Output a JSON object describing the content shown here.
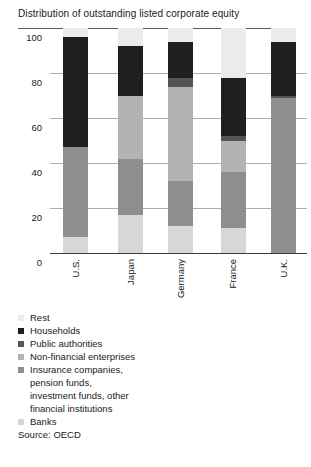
{
  "source_note": "Source: OECD",
  "chart_data": {
    "type": "bar",
    "stacked": true,
    "title": "Distribution of outstanding listed corporate equity",
    "categories": [
      "U.S.",
      "Japan",
      "Germany",
      "France",
      "U.K."
    ],
    "series": [
      {
        "name": "Rest",
        "color": "#ebebeb",
        "values": [
          4,
          8,
          6,
          22,
          6
        ]
      },
      {
        "name": "Households",
        "color": "#1f1f1f",
        "values": [
          49,
          22,
          16,
          26,
          24
        ]
      },
      {
        "name": "Public authorities",
        "color": "#555555",
        "values": [
          0,
          0,
          4,
          2,
          1
        ]
      },
      {
        "name": "Non-financial enterprises",
        "color": "#b3b3b3",
        "values": [
          0,
          28,
          42,
          14,
          0
        ]
      },
      {
        "name": "Insurance companies, pension funds, investment funds, other financial institutions",
        "color": "#8e8e8e",
        "values": [
          40,
          25,
          20,
          25,
          69
        ]
      },
      {
        "name": "Banks",
        "color": "#d7d7d7",
        "values": [
          7,
          17,
          12,
          11,
          0
        ]
      }
    ],
    "ylim": [
      0,
      100
    ],
    "yticks": [
      100,
      80,
      60,
      40,
      20,
      0
    ],
    "grid": true,
    "legend_position": "bottom-left"
  },
  "legend": {
    "items": [
      {
        "label": "Rest",
        "color": "#ebebeb"
      },
      {
        "label": "Households",
        "color": "#1f1f1f"
      },
      {
        "label": "Public authorities",
        "color": "#555555"
      },
      {
        "label": "Non-financial enterprises",
        "color": "#b3b3b3"
      },
      {
        "label": "Insurance companies,\npension funds,\ninvestment funds, other\nfinancial institutions",
        "color": "#8e8e8e"
      },
      {
        "label": "Banks",
        "color": "#d7d7d7"
      }
    ]
  }
}
